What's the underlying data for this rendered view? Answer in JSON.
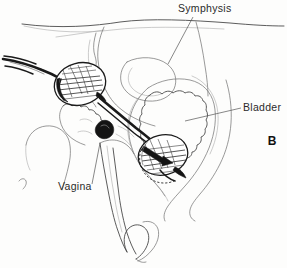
{
  "figure": {
    "panel_letter": "B",
    "type": "medical-line-illustration",
    "background_color": "#fdfdfc",
    "ink_color": "#1a1a1a",
    "label_color": "#2b2b2b",
    "leader_color": "#555555"
  },
  "labels": [
    {
      "id": "symphysis",
      "text": "Symphysis",
      "x": 178,
      "y": 12,
      "anchor": "start",
      "leader": {
        "x1": 193,
        "y1": 17,
        "x2": 168,
        "y2": 64
      }
    },
    {
      "id": "bladder",
      "text": "Bladder",
      "x": 243,
      "y": 111,
      "anchor": "start",
      "leader": {
        "x1": 241,
        "y1": 108,
        "x2": 185,
        "y2": 121
      }
    },
    {
      "id": "vagina",
      "text": "Vagina",
      "x": 58,
      "y": 190,
      "anchor": "start",
      "leader": {
        "x1": 92,
        "y1": 184,
        "x2": 100,
        "y2": 143
      }
    }
  ],
  "panel_label": {
    "text": "B",
    "x": 272,
    "y": 145
  },
  "anatomy": [
    {
      "name": "abdominal-wall-contour"
    },
    {
      "name": "symphysis-pubis"
    },
    {
      "name": "bladder-wall"
    },
    {
      "name": "bladder-lumen"
    },
    {
      "name": "vaginal-canal"
    },
    {
      "name": "perineum"
    },
    {
      "name": "urethra"
    }
  ],
  "device": [
    {
      "name": "catheter-tube-external"
    },
    {
      "name": "outer-balloon"
    },
    {
      "name": "connecting-shaft"
    },
    {
      "name": "shaft-collar"
    },
    {
      "name": "inner-balloon"
    }
  ]
}
